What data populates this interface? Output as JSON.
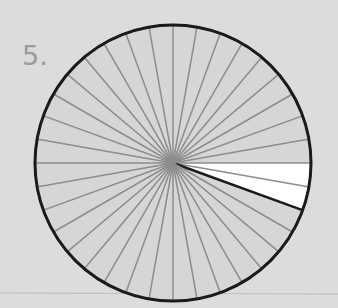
{
  "problem": {
    "number_label": "5.",
    "figure": {
      "type": "circle-fraction",
      "total_sectors": 36,
      "shaded_sectors": 2,
      "shaded_color": "#ffffff",
      "fill_color": "#d6d6d6",
      "spoke_color": "#8c8c8c",
      "outline_color": "#1a1a1a"
    }
  }
}
